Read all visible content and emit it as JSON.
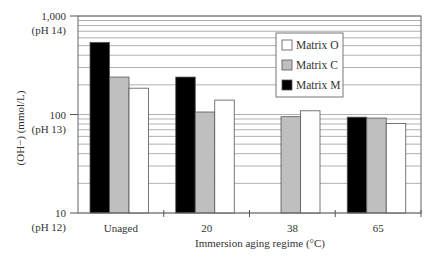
{
  "chart_data": {
    "type": "bar",
    "title": "",
    "xlabel": "Immersion aging regime (°C)",
    "ylabel": "(OH−) (mmol/L)",
    "yscale": "log",
    "ylim": [
      10,
      1000
    ],
    "y_ticks": [
      {
        "value": 1000,
        "label": "1,000",
        "sublabel": "(pH 14)"
      },
      {
        "value": 100,
        "label": "100",
        "sublabel": "(pH 13)"
      },
      {
        "value": 10,
        "label": "10",
        "sublabel": "(pH 12)"
      }
    ],
    "grid": true,
    "legend_position": "upper right (inside)",
    "categories": [
      "Unaged",
      "20",
      "38",
      "65"
    ],
    "series": [
      {
        "name": "Matrix M",
        "color": "#000000",
        "values": [
          540,
          240,
          null,
          94
        ]
      },
      {
        "name": "Matrix C",
        "color": "#bfbfbf",
        "values": [
          240,
          106,
          95,
          92
        ]
      },
      {
        "name": "Matrix O",
        "color": "#ffffff",
        "values": [
          185,
          140,
          109,
          81
        ]
      }
    ],
    "legend_order": [
      "Matrix O",
      "Matrix C",
      "Matrix M"
    ]
  }
}
